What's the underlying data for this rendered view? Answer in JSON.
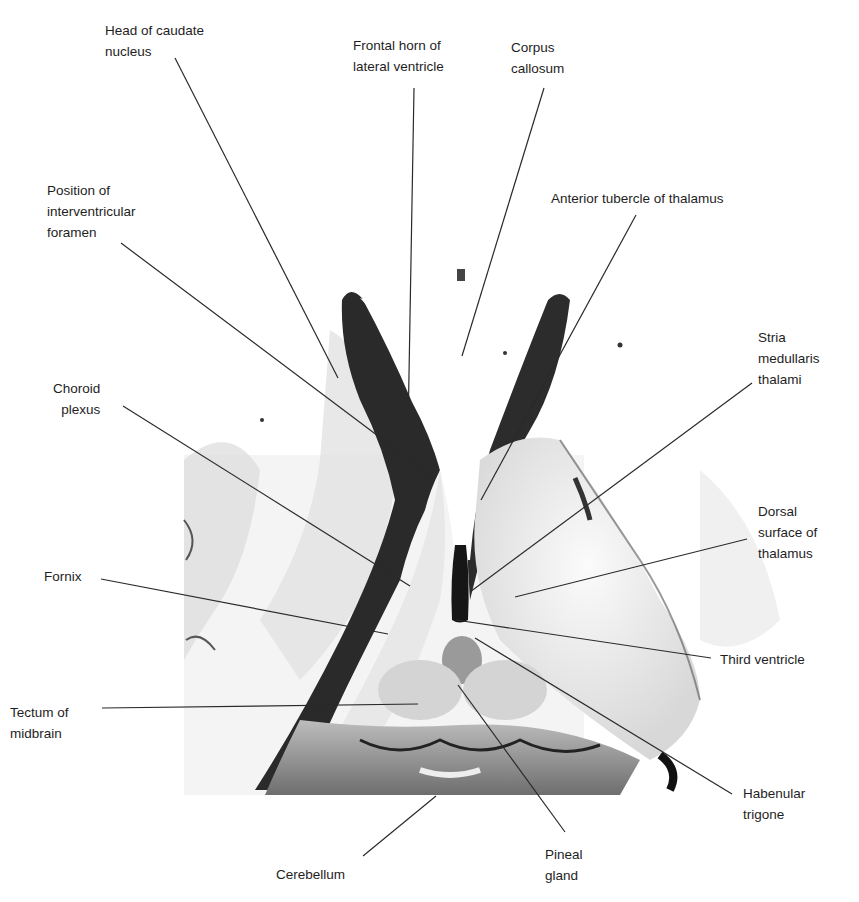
{
  "figure": {
    "colors": {
      "background": "#ffffff",
      "leader_line": "#2a2a2a",
      "text": "#1e1e1e",
      "specimen_dark": "#1a1a1a",
      "specimen_mid": "#8a8a8a",
      "specimen_light": "#e8e8e8"
    }
  },
  "labels": [
    {
      "id": "head-of-caudate-nucleus",
      "text": "Head of caudate\nnucleus",
      "x": 105,
      "y": 20,
      "align": "left",
      "line": [
        [
          175,
          58
        ],
        [
          338,
          378
        ]
      ]
    },
    {
      "id": "frontal-horn-of-lateral-ventricle",
      "text": "Frontal horn of\nlateral ventricle",
      "x": 353,
      "y": 35,
      "align": "left",
      "line": [
        [
          414,
          88
        ],
        [
          408,
          432
        ]
      ]
    },
    {
      "id": "corpus-callosum",
      "text": "Corpus\ncallosum",
      "x": 511,
      "y": 37,
      "align": "left",
      "line": [
        [
          544,
          88
        ],
        [
          462,
          356
        ]
      ]
    },
    {
      "id": "position-of-interventricular-foramen",
      "text": "Position of\ninterventricular\nforamen",
      "x": 47,
      "y": 180,
      "align": "left",
      "line": [
        [
          121,
          243
        ],
        [
          434,
          478
        ]
      ]
    },
    {
      "id": "anterior-tubercle-of-thalamus",
      "text": "Anterior tubercle of thalamus",
      "x": 551,
      "y": 188,
      "align": "left",
      "line": [
        [
          636,
          215
        ],
        [
          481,
          500
        ]
      ]
    },
    {
      "id": "stria-medullaris-thalami",
      "text": "Stria\nmedullaris\nthalami",
      "x": 758,
      "y": 327,
      "align": "left",
      "line": [
        [
          752,
          383
        ],
        [
          470,
          592
        ]
      ]
    },
    {
      "id": "choroid-plexus",
      "text": "Choroid\nplexus",
      "x": 53,
      "y": 378,
      "align": "right",
      "line": [
        [
          123,
          406
        ],
        [
          410,
          586
        ]
      ]
    },
    {
      "id": "dorsal-surface-of-thalamus",
      "text": "Dorsal\nsurface of\nthalamus",
      "x": 758,
      "y": 501,
      "align": "left",
      "line": [
        [
          747,
          539
        ],
        [
          515,
          597
        ]
      ]
    },
    {
      "id": "fornix",
      "text": "Fornix",
      "x": 44,
      "y": 566,
      "align": "left",
      "line": [
        [
          101,
          579
        ],
        [
          388,
          634
        ]
      ]
    },
    {
      "id": "third-ventricle",
      "text": "Third ventricle",
      "x": 720,
      "y": 649,
      "align": "left",
      "line": [
        [
          711,
          658
        ],
        [
          456,
          620
        ]
      ]
    },
    {
      "id": "tectum-of-midbrain",
      "text": "Tectum of\nmidbrain",
      "x": 10,
      "y": 702,
      "align": "left",
      "line": [
        [
          102,
          708
        ],
        [
          418,
          704
        ]
      ]
    },
    {
      "id": "habenular-trigone",
      "text": "Habenular\ntrigone",
      "x": 743,
      "y": 783,
      "align": "left",
      "line": [
        [
          732,
          794
        ],
        [
          475,
          638
        ]
      ]
    },
    {
      "id": "cerebellum",
      "text": "Cerebellum",
      "x": 276,
      "y": 864,
      "align": "left",
      "line": [
        [
          363,
          856
        ],
        [
          436,
          796
        ]
      ]
    },
    {
      "id": "pineal-gland",
      "text": "Pineal\ngland",
      "x": 545,
      "y": 844,
      "align": "left",
      "line": [
        [
          565,
          832
        ],
        [
          458,
          685
        ]
      ]
    }
  ]
}
